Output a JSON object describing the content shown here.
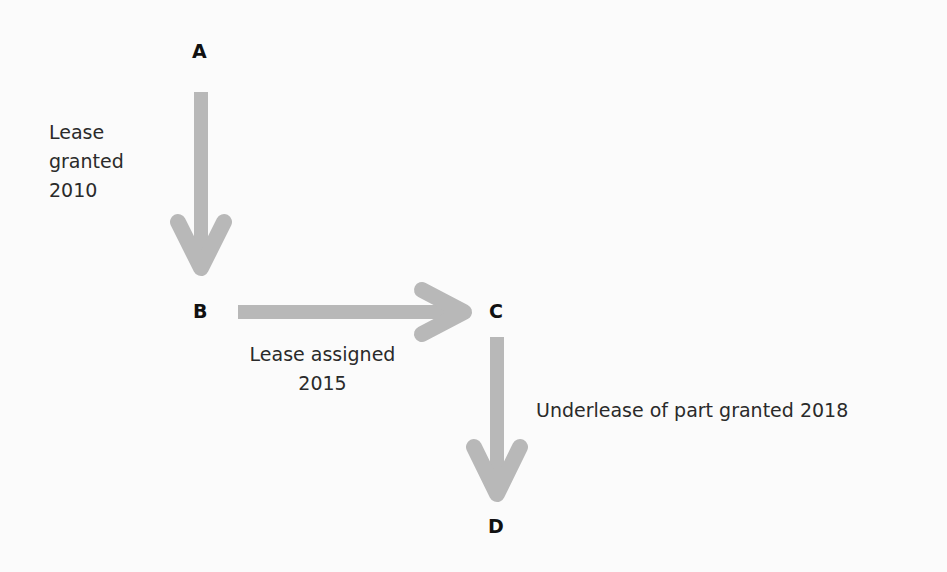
{
  "diagram": {
    "nodes": [
      {
        "id": "A",
        "label": "A"
      },
      {
        "id": "B",
        "label": "B"
      },
      {
        "id": "C",
        "label": "C"
      },
      {
        "id": "D",
        "label": "D"
      }
    ],
    "edges": [
      {
        "from": "A",
        "to": "B",
        "label_lines": [
          "Lease",
          "granted",
          "2010"
        ]
      },
      {
        "from": "B",
        "to": "C",
        "label_lines": [
          "Lease assigned",
          "2015"
        ]
      },
      {
        "from": "C",
        "to": "D",
        "label_lines": [
          "Underlease of part granted 2018"
        ]
      }
    ],
    "arrow_color": "#b8b8b8"
  }
}
